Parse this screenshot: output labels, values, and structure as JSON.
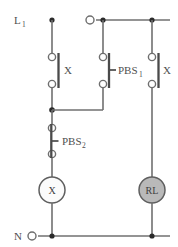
{
  "diagram": {
    "type": "ladder-control-circuit",
    "rails": {
      "line_label": "L",
      "line_subscript": "1",
      "neutral_label": "N"
    },
    "branches": [
      {
        "id": "seal-in-branch",
        "x": 52,
        "components": [
          {
            "kind": "contact-no",
            "label": "X",
            "label_subscript": ""
          },
          {
            "kind": "pushbutton-nc",
            "label": "PBS",
            "label_subscript": "2"
          },
          {
            "kind": "coil",
            "label": "X",
            "fill": "open"
          }
        ]
      },
      {
        "id": "start-branch",
        "x": 103,
        "components": [
          {
            "kind": "pushbutton-no",
            "label": "PBS",
            "label_subscript": "1"
          }
        ]
      },
      {
        "id": "lamp-branch",
        "x": 152,
        "components": [
          {
            "kind": "contact-no",
            "label": "X",
            "label_subscript": ""
          },
          {
            "kind": "lamp",
            "label": "RL",
            "fill": "gray"
          }
        ]
      }
    ],
    "labels": {
      "line_terminal": "L",
      "line_terminal_sub": "1",
      "neutral_terminal": "N",
      "contact_x_left": "X",
      "contact_x_right": "X",
      "pushbutton_1": "PBS",
      "pushbutton_1_sub": "1",
      "pushbutton_2": "PBS",
      "pushbutton_2_sub": "2",
      "coil_x": "X",
      "lamp_rl": "RL"
    },
    "colors": {
      "wire": "#707070",
      "node": "#2b2b2b",
      "contact_bar": "#4a4a4a",
      "coil_fill": "#fbfbfb",
      "lamp_fill": "#b9b9b9",
      "text": "#4f4f4f",
      "background": "#ffffff"
    }
  }
}
